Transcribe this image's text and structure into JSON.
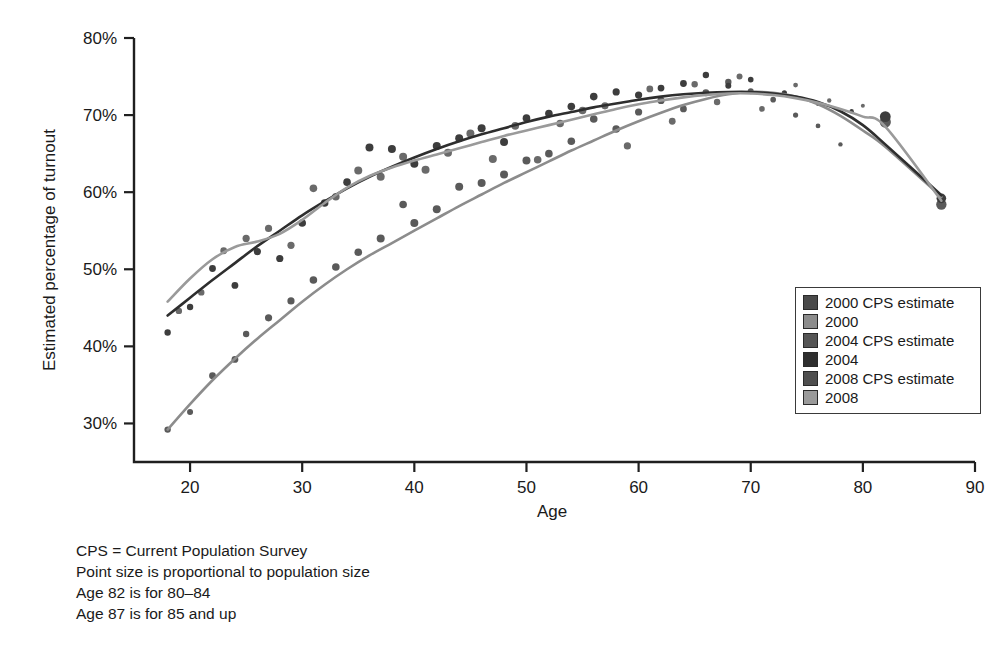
{
  "chart_data": {
    "type": "scatter",
    "title": "",
    "subtitle": "",
    "xlabel": "Age",
    "ylabel": "Estimated percentage of turnout",
    "xlim": [
      15,
      90
    ],
    "ylim": [
      25,
      80
    ],
    "xticks": [
      20,
      30,
      40,
      50,
      60,
      70,
      80,
      90
    ],
    "xticklabels": [
      "20",
      "30",
      "40",
      "50",
      "60",
      "70",
      "80",
      "90"
    ],
    "yticks": [
      30,
      40,
      50,
      60,
      70,
      80
    ],
    "yticklabels": [
      "30%",
      "40%",
      "50%",
      "60%",
      "70%",
      "80%"
    ],
    "grid": false,
    "legend_position": "right-middle",
    "legend": [
      {
        "label": "2000 CPS estimate",
        "color": "#4a4a4a",
        "kind": "points"
      },
      {
        "label": "2000",
        "color": "#8c8c8c",
        "kind": "line"
      },
      {
        "label": "2004 CPS estimate",
        "color": "#555555",
        "kind": "points"
      },
      {
        "label": "2004",
        "color": "#2e2e2e",
        "kind": "line"
      },
      {
        "label": "2008 CPS estimate",
        "color": "#4f4f4f",
        "kind": "points"
      },
      {
        "label": "2008",
        "color": "#9a9a9a",
        "kind": "line"
      }
    ],
    "series": [
      {
        "name": "2000",
        "color": "#8c8c8c",
        "kind": "line",
        "x": [
          18,
          20,
          22,
          24,
          26,
          28,
          30,
          32,
          34,
          36,
          38,
          40,
          42,
          44,
          46,
          48,
          50,
          52,
          54,
          56,
          58,
          60,
          62,
          64,
          66,
          68,
          70,
          72,
          74,
          76,
          78,
          80,
          82,
          87
        ],
        "y": [
          29.2,
          32.5,
          35.6,
          38.4,
          41.0,
          43.4,
          45.8,
          48.0,
          50.0,
          51.8,
          53.4,
          55.0,
          56.6,
          58.2,
          59.7,
          61.2,
          62.6,
          64.0,
          65.4,
          66.7,
          68.0,
          69.2,
          70.3,
          71.3,
          72.1,
          72.7,
          73.0,
          72.9,
          72.4,
          71.4,
          69.9,
          68.0,
          65.9,
          59.4
        ]
      },
      {
        "name": "2004",
        "color": "#2e2e2e",
        "kind": "line",
        "x": [
          18,
          20,
          22,
          24,
          26,
          28,
          30,
          32,
          34,
          36,
          38,
          40,
          42,
          44,
          46,
          48,
          50,
          52,
          54,
          56,
          58,
          60,
          62,
          64,
          66,
          68,
          70,
          72,
          74,
          76,
          78,
          80,
          82,
          87
        ],
        "y": [
          44.0,
          46.3,
          48.6,
          50.8,
          53.0,
          55.0,
          57.0,
          58.8,
          60.5,
          62.0,
          63.3,
          64.5,
          65.6,
          66.6,
          67.5,
          68.3,
          69.1,
          69.8,
          70.4,
          71.0,
          71.5,
          72.0,
          72.4,
          72.7,
          72.9,
          73.0,
          73.0,
          72.8,
          72.4,
          71.7,
          70.5,
          68.7,
          66.2,
          59.6
        ]
      },
      {
        "name": "2008",
        "color": "#9a9a9a",
        "kind": "line",
        "x": [
          18,
          20,
          22,
          24,
          26,
          28,
          30,
          32,
          34,
          36,
          38,
          40,
          42,
          44,
          46,
          48,
          50,
          52,
          54,
          56,
          58,
          60,
          62,
          64,
          66,
          68,
          70,
          72,
          74,
          76,
          78,
          80,
          82,
          87
        ],
        "y": [
          45.8,
          48.8,
          51.3,
          52.9,
          53.6,
          54.6,
          56.4,
          58.6,
          60.6,
          62.1,
          63.2,
          64.1,
          64.9,
          65.7,
          66.5,
          67.3,
          68.0,
          68.7,
          69.4,
          70.1,
          70.8,
          71.4,
          71.9,
          72.3,
          72.6,
          72.8,
          72.8,
          72.6,
          72.2,
          71.6,
          70.8,
          69.8,
          68.5,
          58.9
        ]
      }
    ],
    "points": [
      {
        "series": "2000",
        "x": 18,
        "y": 29.2,
        "r": 3.2
      },
      {
        "series": "2000",
        "x": 20,
        "y": 31.5,
        "r": 3.0
      },
      {
        "series": "2000",
        "x": 22,
        "y": 36.2,
        "r": 3.4
      },
      {
        "series": "2000",
        "x": 24,
        "y": 38.3,
        "r": 3.4
      },
      {
        "series": "2000",
        "x": 25,
        "y": 41.6,
        "r": 3.2
      },
      {
        "series": "2000",
        "x": 27,
        "y": 43.7,
        "r": 3.6
      },
      {
        "series": "2000",
        "x": 29,
        "y": 45.9,
        "r": 3.6
      },
      {
        "series": "2000",
        "x": 31,
        "y": 48.6,
        "r": 3.8
      },
      {
        "series": "2000",
        "x": 33,
        "y": 50.3,
        "r": 3.8
      },
      {
        "series": "2000",
        "x": 35,
        "y": 52.2,
        "r": 3.8
      },
      {
        "series": "2000",
        "x": 37,
        "y": 54.0,
        "r": 4.0
      },
      {
        "series": "2000",
        "x": 39,
        "y": 58.4,
        "r": 3.8
      },
      {
        "series": "2000",
        "x": 40,
        "y": 56.0,
        "r": 4.0
      },
      {
        "series": "2000",
        "x": 42,
        "y": 57.8,
        "r": 4.0
      },
      {
        "series": "2000",
        "x": 44,
        "y": 60.7,
        "r": 4.0
      },
      {
        "series": "2000",
        "x": 46,
        "y": 61.2,
        "r": 4.0
      },
      {
        "series": "2000",
        "x": 48,
        "y": 62.3,
        "r": 4.0
      },
      {
        "series": "2000",
        "x": 50,
        "y": 64.1,
        "r": 4.0
      },
      {
        "series": "2000",
        "x": 52,
        "y": 65.0,
        "r": 3.8
      },
      {
        "series": "2000",
        "x": 54,
        "y": 66.6,
        "r": 3.8
      },
      {
        "series": "2000",
        "x": 56,
        "y": 69.5,
        "r": 3.8
      },
      {
        "series": "2000",
        "x": 58,
        "y": 68.2,
        "r": 3.8
      },
      {
        "series": "2000",
        "x": 60,
        "y": 70.4,
        "r": 3.6
      },
      {
        "series": "2000",
        "x": 62,
        "y": 71.9,
        "r": 3.6
      },
      {
        "series": "2000",
        "x": 64,
        "y": 70.8,
        "r": 3.4
      },
      {
        "series": "2000",
        "x": 66,
        "y": 72.9,
        "r": 3.4
      },
      {
        "series": "2000",
        "x": 68,
        "y": 74.3,
        "r": 3.2
      },
      {
        "series": "2000",
        "x": 70,
        "y": 73.1,
        "r": 3.0
      },
      {
        "series": "2000",
        "x": 72,
        "y": 72.0,
        "r": 2.8
      },
      {
        "series": "2000",
        "x": 74,
        "y": 70.0,
        "r": 2.6
      },
      {
        "series": "2000",
        "x": 76,
        "y": 68.6,
        "r": 2.4
      },
      {
        "series": "2000",
        "x": 78,
        "y": 66.2,
        "r": 2.2
      },
      {
        "series": "2000",
        "x": 82,
        "y": 69.1,
        "r": 5.6
      },
      {
        "series": "2000",
        "x": 87,
        "y": 58.4,
        "r": 5.2
      },
      {
        "series": "2004",
        "x": 18,
        "y": 41.8,
        "r": 3.2
      },
      {
        "series": "2004",
        "x": 20,
        "y": 45.1,
        "r": 3.2
      },
      {
        "series": "2004",
        "x": 22,
        "y": 50.1,
        "r": 3.4
      },
      {
        "series": "2004",
        "x": 24,
        "y": 47.9,
        "r": 3.4
      },
      {
        "series": "2004",
        "x": 26,
        "y": 52.3,
        "r": 3.6
      },
      {
        "series": "2004",
        "x": 28,
        "y": 51.4,
        "r": 3.6
      },
      {
        "series": "2004",
        "x": 30,
        "y": 56.0,
        "r": 3.8
      },
      {
        "series": "2004",
        "x": 32,
        "y": 58.6,
        "r": 3.8
      },
      {
        "series": "2004",
        "x": 34,
        "y": 61.3,
        "r": 3.8
      },
      {
        "series": "2004",
        "x": 36,
        "y": 65.8,
        "r": 4.0
      },
      {
        "series": "2004",
        "x": 38,
        "y": 65.6,
        "r": 4.0
      },
      {
        "series": "2004",
        "x": 40,
        "y": 63.7,
        "r": 4.0
      },
      {
        "series": "2004",
        "x": 42,
        "y": 66.0,
        "r": 4.0
      },
      {
        "series": "2004",
        "x": 44,
        "y": 67.0,
        "r": 4.0
      },
      {
        "series": "2004",
        "x": 46,
        "y": 68.3,
        "r": 4.0
      },
      {
        "series": "2004",
        "x": 48,
        "y": 66.5,
        "r": 4.0
      },
      {
        "series": "2004",
        "x": 50,
        "y": 69.6,
        "r": 3.8
      },
      {
        "series": "2004",
        "x": 52,
        "y": 70.2,
        "r": 3.8
      },
      {
        "series": "2004",
        "x": 54,
        "y": 71.1,
        "r": 3.8
      },
      {
        "series": "2004",
        "x": 56,
        "y": 72.4,
        "r": 3.8
      },
      {
        "series": "2004",
        "x": 58,
        "y": 73.0,
        "r": 3.6
      },
      {
        "series": "2004",
        "x": 60,
        "y": 72.6,
        "r": 3.6
      },
      {
        "series": "2004",
        "x": 62,
        "y": 73.5,
        "r": 3.4
      },
      {
        "series": "2004",
        "x": 64,
        "y": 74.1,
        "r": 3.4
      },
      {
        "series": "2004",
        "x": 66,
        "y": 75.2,
        "r": 3.2
      },
      {
        "series": "2004",
        "x": 68,
        "y": 73.8,
        "r": 3.0
      },
      {
        "series": "2004",
        "x": 70,
        "y": 74.6,
        "r": 2.8
      },
      {
        "series": "2004",
        "x": 73,
        "y": 72.9,
        "r": 2.6
      },
      {
        "series": "2004",
        "x": 76,
        "y": 71.5,
        "r": 2.4
      },
      {
        "series": "2004",
        "x": 79,
        "y": 70.5,
        "r": 2.2
      },
      {
        "series": "2004",
        "x": 82,
        "y": 69.8,
        "r": 5.4
      },
      {
        "series": "2004",
        "x": 87,
        "y": 59.2,
        "r": 4.8
      },
      {
        "series": "2008",
        "x": 19,
        "y": 44.6,
        "r": 3.2
      },
      {
        "series": "2008",
        "x": 21,
        "y": 47.0,
        "r": 3.2
      },
      {
        "series": "2008",
        "x": 23,
        "y": 52.4,
        "r": 3.4
      },
      {
        "series": "2008",
        "x": 25,
        "y": 54.0,
        "r": 3.6
      },
      {
        "series": "2008",
        "x": 27,
        "y": 55.3,
        "r": 3.6
      },
      {
        "series": "2008",
        "x": 29,
        "y": 53.1,
        "r": 3.6
      },
      {
        "series": "2008",
        "x": 31,
        "y": 60.5,
        "r": 3.8
      },
      {
        "series": "2008",
        "x": 33,
        "y": 59.4,
        "r": 3.8
      },
      {
        "series": "2008",
        "x": 35,
        "y": 62.8,
        "r": 4.0
      },
      {
        "series": "2008",
        "x": 37,
        "y": 62.0,
        "r": 4.0
      },
      {
        "series": "2008",
        "x": 39,
        "y": 64.6,
        "r": 4.0
      },
      {
        "series": "2008",
        "x": 41,
        "y": 62.9,
        "r": 4.0
      },
      {
        "series": "2008",
        "x": 43,
        "y": 65.1,
        "r": 4.0
      },
      {
        "series": "2008",
        "x": 45,
        "y": 67.6,
        "r": 4.0
      },
      {
        "series": "2008",
        "x": 47,
        "y": 64.3,
        "r": 4.0
      },
      {
        "series": "2008",
        "x": 49,
        "y": 68.6,
        "r": 3.8
      },
      {
        "series": "2008",
        "x": 51,
        "y": 64.2,
        "r": 3.8
      },
      {
        "series": "2008",
        "x": 53,
        "y": 68.9,
        "r": 3.8
      },
      {
        "series": "2008",
        "x": 55,
        "y": 70.6,
        "r": 3.8
      },
      {
        "series": "2008",
        "x": 57,
        "y": 71.2,
        "r": 3.6
      },
      {
        "series": "2008",
        "x": 59,
        "y": 66.0,
        "r": 3.6
      },
      {
        "series": "2008",
        "x": 61,
        "y": 73.4,
        "r": 3.4
      },
      {
        "series": "2008",
        "x": 63,
        "y": 69.2,
        "r": 3.4
      },
      {
        "series": "2008",
        "x": 65,
        "y": 74.0,
        "r": 3.2
      },
      {
        "series": "2008",
        "x": 67,
        "y": 71.7,
        "r": 3.2
      },
      {
        "series": "2008",
        "x": 69,
        "y": 75.0,
        "r": 3.0
      },
      {
        "series": "2008",
        "x": 71,
        "y": 70.8,
        "r": 2.8
      },
      {
        "series": "2008",
        "x": 74,
        "y": 73.9,
        "r": 2.4
      },
      {
        "series": "2008",
        "x": 77,
        "y": 71.9,
        "r": 2.2
      },
      {
        "series": "2008",
        "x": 80,
        "y": 71.2,
        "r": 2.0
      }
    ]
  },
  "footnotes": [
    "CPS = Current Population Survey",
    "Point size is proportional to population size",
    "Age 82 is for 80–84",
    "Age 87 is for 85 and up"
  ]
}
